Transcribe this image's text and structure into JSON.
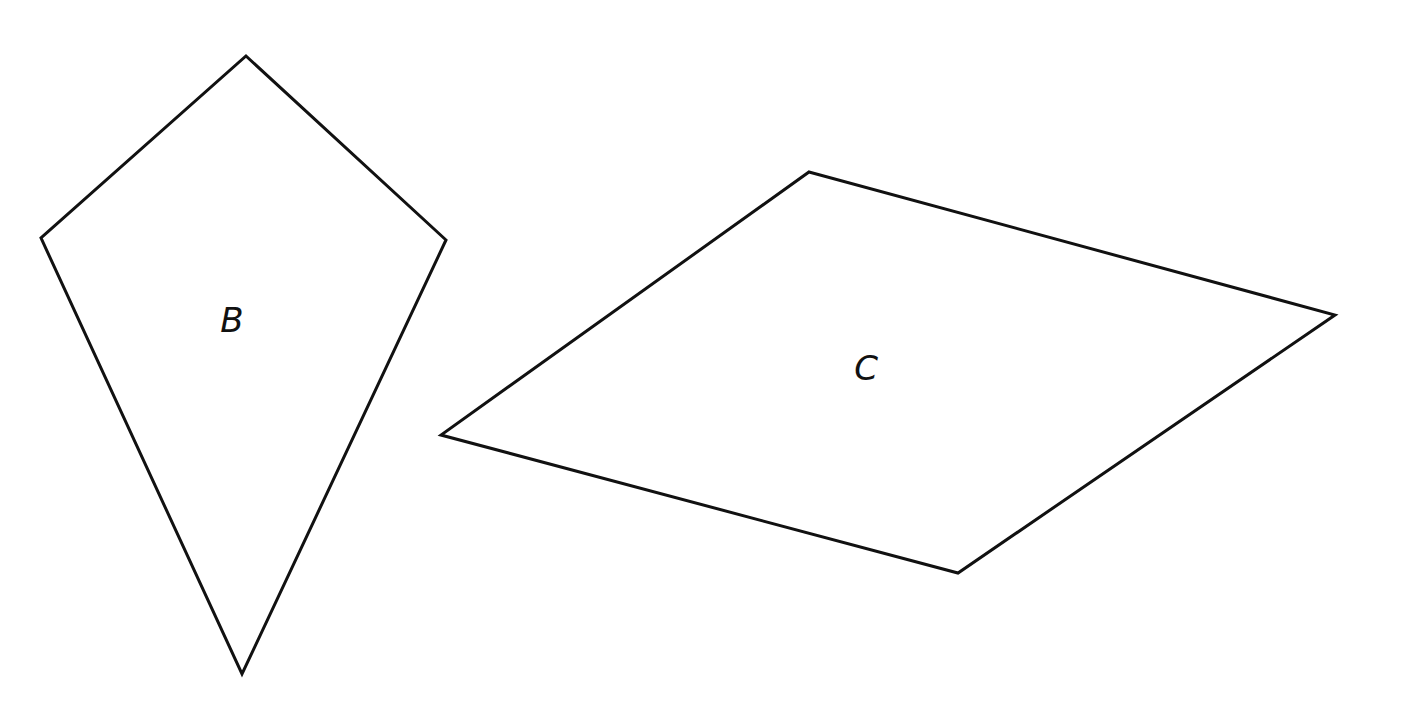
{
  "diagram": {
    "shapes": [
      {
        "id": "B",
        "label": "B",
        "type": "kite",
        "points": [
          [
            246,
            56
          ],
          [
            446,
            240
          ],
          [
            242,
            674
          ],
          [
            41,
            238
          ]
        ],
        "label_pos": [
          232,
          332
        ]
      },
      {
        "id": "C",
        "label": "C",
        "type": "parallelogram",
        "points": [
          [
            809,
            172
          ],
          [
            1335,
            315
          ],
          [
            958,
            573
          ],
          [
            441,
            435
          ]
        ],
        "label_pos": [
          866,
          380
        ]
      }
    ],
    "stroke_color": "#111111",
    "background": "#ffffff"
  }
}
